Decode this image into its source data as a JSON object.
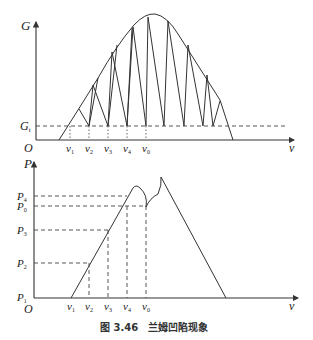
{
  "top_chart": {
    "y_axis_label": "G",
    "x_axis_label": "ν",
    "origin_label": "O",
    "threshold_label": {
      "main": "G",
      "sub": "t"
    },
    "x_ticks": [
      {
        "main": "ν",
        "sub": "1"
      },
      {
        "main": "ν",
        "sub": "2"
      },
      {
        "main": "ν",
        "sub": "3"
      },
      {
        "main": "ν",
        "sub": "4"
      },
      {
        "main": "ν",
        "sub": "0"
      }
    ]
  },
  "bottom_chart": {
    "y_axis_label": "P",
    "x_axis_label": "ν",
    "origin_label": "O",
    "y_ticks": [
      {
        "main": "P",
        "sub": "4"
      },
      {
        "main": "P",
        "sub": "0"
      },
      {
        "main": "P",
        "sub": "3"
      },
      {
        "main": "P",
        "sub": "2"
      },
      {
        "main": "P",
        "sub": "1"
      }
    ],
    "x_ticks": [
      {
        "main": "ν",
        "sub": "1"
      },
      {
        "main": "ν",
        "sub": "2"
      },
      {
        "main": "ν",
        "sub": "3"
      },
      {
        "main": "ν",
        "sub": "4"
      },
      {
        "main": "ν",
        "sub": "0"
      }
    ]
  },
  "caption": {
    "number": "图 3.46",
    "title": "兰姆凹陷现象"
  }
}
